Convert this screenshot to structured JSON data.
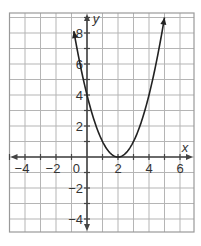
{
  "chart_data": {
    "type": "line",
    "title": "",
    "xlabel": "x",
    "ylabel": "y",
    "function": "y = (x - 2)^2",
    "xlim": [
      -5,
      6.9
    ],
    "ylim": [
      -4.8,
      9.3
    ],
    "grid": true,
    "grid_step": 1,
    "x_ticks": [
      -4,
      -2,
      2,
      4,
      6
    ],
    "y_ticks": [
      -4,
      -2,
      2,
      4,
      6,
      8
    ],
    "origin_label": "0",
    "series": [
      {
        "name": "parabola",
        "x": [
          -0.85,
          0,
          0.5,
          1,
          1.5,
          2,
          2.5,
          3,
          3.5,
          4,
          4.5,
          5
        ],
        "y": [
          8.1,
          4,
          2.25,
          1,
          0.25,
          0,
          0.25,
          1,
          2.25,
          4,
          6.25,
          9
        ],
        "arrows": "both-ends"
      }
    ],
    "vertex": [
      2,
      0
    ],
    "y_intercept": 4
  },
  "colors": {
    "grid": "#b5b5b5",
    "axes": "#444444",
    "curve": "#222222",
    "border": "#9a9a9a"
  }
}
